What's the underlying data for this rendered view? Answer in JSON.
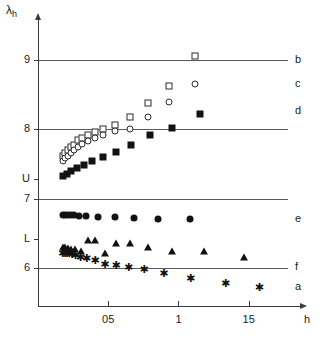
{
  "chart_data": {
    "type": "scatter",
    "title": "",
    "xlabel": "h",
    "ylabel": "λ",
    "ylabel_sub": "h",
    "xlim": [
      0.0,
      1.78
    ],
    "ylim": [
      5.45,
      9.55
    ],
    "grid": true,
    "gridlines_y": [
      9,
      8,
      7,
      6
    ],
    "legend_position": "right-edge",
    "xticks": [
      0.5,
      1.0,
      1.5
    ],
    "xtick_labels": [
      "05",
      "1",
      "15"
    ],
    "yticks": [
      9,
      8,
      7,
      6
    ],
    "ytick_labels": [
      "9",
      "8",
      "7",
      "6"
    ],
    "y_special_ticks": [
      {
        "label": "U",
        "value": 7.28
      },
      {
        "label": "L",
        "value": 6.42
      }
    ],
    "series": [
      {
        "name": "b",
        "label": "b",
        "marker": "open-square",
        "label_y": 9.0,
        "points": [
          [
            0.175,
            7.62
          ],
          [
            0.195,
            7.66
          ],
          [
            0.215,
            7.7
          ],
          [
            0.235,
            7.74
          ],
          [
            0.255,
            7.78
          ],
          [
            0.285,
            7.84
          ],
          [
            0.315,
            7.88
          ],
          [
            0.355,
            7.92
          ],
          [
            0.405,
            7.96
          ],
          [
            0.465,
            8.0
          ],
          [
            0.545,
            8.06
          ],
          [
            0.655,
            8.18
          ],
          [
            0.785,
            8.38
          ],
          [
            0.93,
            8.62
          ],
          [
            1.12,
            9.06
          ]
        ]
      },
      {
        "name": "c",
        "label": "c",
        "marker": "open-circle",
        "label_y": 8.66,
        "points": [
          [
            0.175,
            7.54
          ],
          [
            0.195,
            7.58
          ],
          [
            0.215,
            7.62
          ],
          [
            0.235,
            7.66
          ],
          [
            0.255,
            7.7
          ],
          [
            0.285,
            7.74
          ],
          [
            0.315,
            7.79
          ],
          [
            0.355,
            7.83
          ],
          [
            0.405,
            7.87
          ],
          [
            0.465,
            7.92
          ],
          [
            0.545,
            7.97
          ],
          [
            0.655,
            8.01
          ],
          [
            0.785,
            8.18
          ],
          [
            0.93,
            8.4
          ],
          [
            1.12,
            8.66
          ]
        ]
      },
      {
        "name": "d",
        "label": "d",
        "marker": "filled-square",
        "label_y": 8.26,
        "points": [
          [
            0.175,
            7.32
          ],
          [
            0.205,
            7.36
          ],
          [
            0.235,
            7.4
          ],
          [
            0.275,
            7.44
          ],
          [
            0.325,
            7.48
          ],
          [
            0.385,
            7.54
          ],
          [
            0.465,
            7.6
          ],
          [
            0.555,
            7.68
          ],
          [
            0.665,
            7.78
          ],
          [
            0.8,
            7.92
          ],
          [
            0.955,
            8.02
          ],
          [
            1.155,
            8.22
          ]
        ]
      },
      {
        "name": "e",
        "label": "e",
        "marker": "filled-circle",
        "label_y": 6.7,
        "points": [
          [
            0.175,
            6.76
          ],
          [
            0.195,
            6.76
          ],
          [
            0.215,
            6.76
          ],
          [
            0.235,
            6.76
          ],
          [
            0.255,
            6.76
          ],
          [
            0.295,
            6.75
          ],
          [
            0.345,
            6.75
          ],
          [
            0.425,
            6.74
          ],
          [
            0.545,
            6.73
          ],
          [
            0.685,
            6.72
          ],
          [
            0.855,
            6.7
          ],
          [
            1.085,
            6.7
          ]
        ]
      },
      {
        "name": "f",
        "label": "f",
        "marker": "triangle",
        "label_y": 6.02,
        "points": [
          [
            0.175,
            6.3
          ],
          [
            0.195,
            6.3
          ],
          [
            0.215,
            6.29
          ],
          [
            0.235,
            6.28
          ],
          [
            0.265,
            6.27
          ],
          [
            0.305,
            6.24
          ],
          [
            0.355,
            6.4
          ],
          [
            0.405,
            6.4
          ],
          [
            0.475,
            6.22
          ],
          [
            0.555,
            6.36
          ],
          [
            0.655,
            6.36
          ],
          [
            0.785,
            6.3
          ],
          [
            0.955,
            6.24
          ],
          [
            1.185,
            6.24
          ],
          [
            1.47,
            6.16
          ]
        ]
      },
      {
        "name": "a",
        "label": "a",
        "marker": "star",
        "label_y": 5.72,
        "points": [
          [
            0.175,
            6.22
          ],
          [
            0.19,
            6.22
          ],
          [
            0.205,
            6.21
          ],
          [
            0.22,
            6.21
          ],
          [
            0.24,
            6.2
          ],
          [
            0.265,
            6.18
          ],
          [
            0.3,
            6.16
          ],
          [
            0.345,
            6.14
          ],
          [
            0.405,
            6.12
          ],
          [
            0.475,
            6.05
          ],
          [
            0.555,
            6.04
          ],
          [
            0.645,
            6.02
          ],
          [
            0.755,
            5.98
          ],
          [
            0.895,
            5.92
          ],
          [
            1.085,
            5.86
          ],
          [
            1.335,
            5.78
          ],
          [
            1.575,
            5.72
          ]
        ]
      }
    ]
  }
}
